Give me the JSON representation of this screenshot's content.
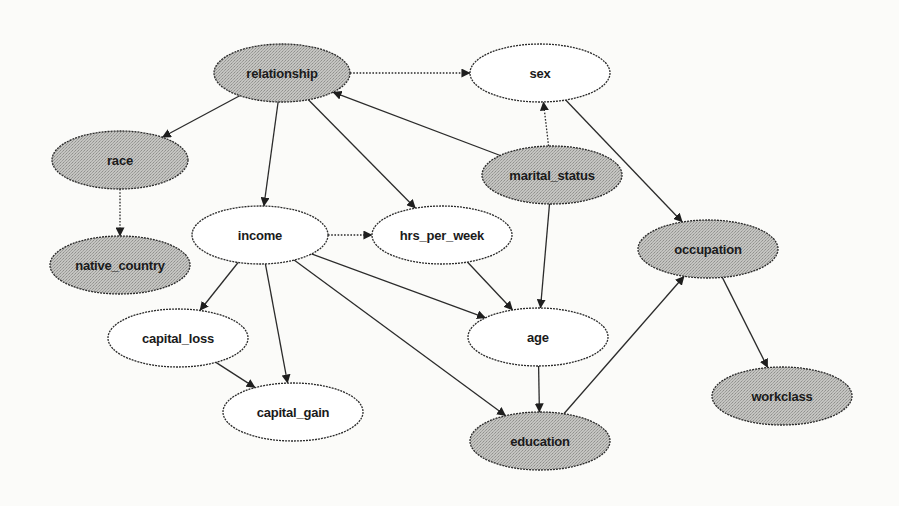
{
  "diagram": {
    "type": "bayesian-network",
    "colors": {
      "shaded_fill": "#b9b9b6",
      "plain_fill": "#ffffff",
      "stroke": "#2b2b2b",
      "background": "#fbfbf9"
    },
    "nodes": [
      {
        "id": "relationship",
        "label": "relationship",
        "shaded": true,
        "cx": 282,
        "cy": 73,
        "rx": 68,
        "ry": 29
      },
      {
        "id": "sex",
        "label": "sex",
        "shaded": false,
        "cx": 540,
        "cy": 73,
        "rx": 70,
        "ry": 29
      },
      {
        "id": "race",
        "label": "race",
        "shaded": true,
        "cx": 120,
        "cy": 160,
        "rx": 68,
        "ry": 29
      },
      {
        "id": "marital_status",
        "label": "marital_status",
        "shaded": true,
        "cx": 552,
        "cy": 175,
        "rx": 70,
        "ry": 29
      },
      {
        "id": "income",
        "label": "income",
        "shaded": false,
        "cx": 260,
        "cy": 235,
        "rx": 68,
        "ry": 29
      },
      {
        "id": "hrs_per_week",
        "label": "hrs_per_week",
        "shaded": false,
        "cx": 442,
        "cy": 235,
        "rx": 70,
        "ry": 29
      },
      {
        "id": "native_country",
        "label": "native_country",
        "shaded": true,
        "cx": 120,
        "cy": 265,
        "rx": 70,
        "ry": 29
      },
      {
        "id": "occupation",
        "label": "occupation",
        "shaded": true,
        "cx": 708,
        "cy": 249,
        "rx": 70,
        "ry": 29
      },
      {
        "id": "capital_loss",
        "label": "capital_loss",
        "shaded": false,
        "cx": 178,
        "cy": 338,
        "rx": 70,
        "ry": 29
      },
      {
        "id": "age",
        "label": "age",
        "shaded": false,
        "cx": 538,
        "cy": 337,
        "rx": 70,
        "ry": 29
      },
      {
        "id": "capital_gain",
        "label": "capital_gain",
        "shaded": false,
        "cx": 293,
        "cy": 412,
        "rx": 70,
        "ry": 29
      },
      {
        "id": "workclass",
        "label": "workclass",
        "shaded": true,
        "cx": 782,
        "cy": 396,
        "rx": 70,
        "ry": 29
      },
      {
        "id": "education",
        "label": "education",
        "shaded": true,
        "cx": 540,
        "cy": 441,
        "rx": 70,
        "ry": 29
      }
    ],
    "edges": [
      {
        "from": "relationship",
        "to": "sex",
        "dotted": true
      },
      {
        "from": "relationship",
        "to": "race",
        "dotted": false
      },
      {
        "from": "relationship",
        "to": "income",
        "dotted": false
      },
      {
        "from": "relationship",
        "to": "hrs_per_week",
        "dotted": false
      },
      {
        "from": "marital_status",
        "to": "relationship",
        "dotted": false
      },
      {
        "from": "marital_status",
        "to": "sex",
        "dotted": true
      },
      {
        "from": "marital_status",
        "to": "age",
        "dotted": false
      },
      {
        "from": "sex",
        "to": "occupation",
        "dotted": false
      },
      {
        "from": "race",
        "to": "native_country",
        "dotted": true
      },
      {
        "from": "income",
        "to": "hrs_per_week",
        "dotted": true
      },
      {
        "from": "income",
        "to": "capital_loss",
        "dotted": false
      },
      {
        "from": "income",
        "to": "capital_gain",
        "dotted": false
      },
      {
        "from": "income",
        "to": "age",
        "dotted": false
      },
      {
        "from": "income",
        "to": "education",
        "dotted": false
      },
      {
        "from": "hrs_per_week",
        "to": "age",
        "dotted": false
      },
      {
        "from": "capital_loss",
        "to": "capital_gain",
        "dotted": false
      },
      {
        "from": "age",
        "to": "education",
        "dotted": false
      },
      {
        "from": "education",
        "to": "occupation",
        "dotted": false
      },
      {
        "from": "occupation",
        "to": "workclass",
        "dotted": false
      }
    ]
  }
}
